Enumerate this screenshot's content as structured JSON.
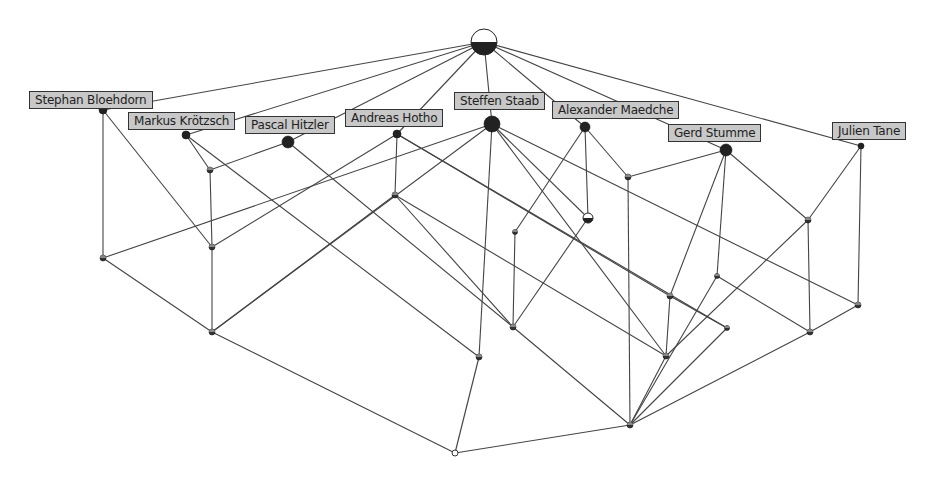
{
  "diagram": {
    "type": "concept-lattice",
    "colors": {
      "edge": "#444444",
      "node_fill": "#222222",
      "label_bg": "#c8c8c8",
      "label_border": "#333333"
    },
    "labels": [
      {
        "id": "SB",
        "text": "Stephan Bloehdorn",
        "x": 29,
        "y": 91
      },
      {
        "id": "MK",
        "text": "Markus Krötzsch",
        "x": 128,
        "y": 112
      },
      {
        "id": "PH",
        "text": "Pascal Hitzler",
        "x": 245,
        "y": 116
      },
      {
        "id": "AH",
        "text": "Andreas Hotho",
        "x": 345,
        "y": 109
      },
      {
        "id": "SS",
        "text": "Steffen Staab",
        "x": 454,
        "y": 92
      },
      {
        "id": "AM",
        "text": "Alexander Maedche",
        "x": 552,
        "y": 101
      },
      {
        "id": "GS",
        "text": "Gerd Stumme",
        "x": 668,
        "y": 124
      },
      {
        "id": "JT",
        "text": "Julien Tane",
        "x": 832,
        "y": 122
      }
    ],
    "nodes": [
      {
        "id": "T",
        "x": 484,
        "y": 42,
        "r": 13,
        "style": "half"
      },
      {
        "id": "SB",
        "x": 103,
        "y": 110,
        "r": 4,
        "style": "filled"
      },
      {
        "id": "MK",
        "x": 186,
        "y": 135,
        "r": 4,
        "style": "filled"
      },
      {
        "id": "PH",
        "x": 288,
        "y": 142,
        "r": 6,
        "style": "filled"
      },
      {
        "id": "AH",
        "x": 397,
        "y": 134,
        "r": 4,
        "style": "filled"
      },
      {
        "id": "SS",
        "x": 492,
        "y": 124,
        "r": 8,
        "style": "filled"
      },
      {
        "id": "AM",
        "x": 585,
        "y": 127,
        "r": 5,
        "style": "filled"
      },
      {
        "id": "GS",
        "x": 726,
        "y": 150,
        "r": 6,
        "style": "filled"
      },
      {
        "id": "JT",
        "x": 861,
        "y": 146,
        "r": 3,
        "style": "filled"
      },
      {
        "id": "n1",
        "x": 210,
        "y": 170,
        "r": 3,
        "style": "small"
      },
      {
        "id": "n2",
        "x": 628,
        "y": 177,
        "r": 3,
        "style": "small"
      },
      {
        "id": "n3",
        "x": 395,
        "y": 195,
        "r": 3,
        "style": "small"
      },
      {
        "id": "n4",
        "x": 515,
        "y": 232,
        "r": 2.5,
        "style": "small"
      },
      {
        "id": "n5",
        "x": 588,
        "y": 218,
        "r": 5,
        "style": "half"
      },
      {
        "id": "n6",
        "x": 808,
        "y": 220,
        "r": 3,
        "style": "small"
      },
      {
        "id": "n7",
        "x": 103,
        "y": 258,
        "r": 3,
        "style": "small"
      },
      {
        "id": "n8",
        "x": 212,
        "y": 247,
        "r": 3,
        "style": "small"
      },
      {
        "id": "n9",
        "x": 717,
        "y": 276,
        "r": 2.5,
        "style": "small"
      },
      {
        "id": "n10",
        "x": 670,
        "y": 296,
        "r": 3,
        "style": "small"
      },
      {
        "id": "n11",
        "x": 858,
        "y": 305,
        "r": 3,
        "style": "small"
      },
      {
        "id": "n12",
        "x": 212,
        "y": 332,
        "r": 3,
        "style": "small"
      },
      {
        "id": "n13",
        "x": 513,
        "y": 327,
        "r": 3,
        "style": "small"
      },
      {
        "id": "n14",
        "x": 727,
        "y": 328,
        "r": 2.5,
        "style": "small"
      },
      {
        "id": "n15",
        "x": 810,
        "y": 332,
        "r": 3,
        "style": "small"
      },
      {
        "id": "n16",
        "x": 666,
        "y": 356,
        "r": 3,
        "style": "small"
      },
      {
        "id": "n17",
        "x": 479,
        "y": 357,
        "r": 3,
        "style": "small"
      },
      {
        "id": "n18",
        "x": 630,
        "y": 425,
        "r": 3,
        "style": "small"
      },
      {
        "id": "B",
        "x": 455,
        "y": 453,
        "r": 3,
        "style": "empty"
      }
    ],
    "edges": [
      [
        "T",
        "SB"
      ],
      [
        "T",
        "MK"
      ],
      [
        "T",
        "PH"
      ],
      [
        "T",
        "AH"
      ],
      [
        "T",
        "SS"
      ],
      [
        "T",
        "AM"
      ],
      [
        "T",
        "GS"
      ],
      [
        "T",
        "JT"
      ],
      [
        "SB",
        "n7"
      ],
      [
        "SB",
        "n8"
      ],
      [
        "MK",
        "n1"
      ],
      [
        "MK",
        "n17"
      ],
      [
        "PH",
        "n1"
      ],
      [
        "PH",
        "n13"
      ],
      [
        "n1",
        "n8"
      ],
      [
        "AH",
        "n3"
      ],
      [
        "AH",
        "n10"
      ],
      [
        "AH",
        "n14"
      ],
      [
        "AH",
        "n8"
      ],
      [
        "SS",
        "n7"
      ],
      [
        "SS",
        "n12"
      ],
      [
        "SS",
        "n17"
      ],
      [
        "SS",
        "n5"
      ],
      [
        "SS",
        "n16"
      ],
      [
        "SS",
        "n11"
      ],
      [
        "n3",
        "n12"
      ],
      [
        "n3",
        "n16"
      ],
      [
        "n3",
        "n13"
      ],
      [
        "AM",
        "n4"
      ],
      [
        "AM",
        "n5"
      ],
      [
        "AM",
        "n2"
      ],
      [
        "GS",
        "n2"
      ],
      [
        "GS",
        "n10"
      ],
      [
        "GS",
        "n9"
      ],
      [
        "GS",
        "n6"
      ],
      [
        "JT",
        "n6"
      ],
      [
        "JT",
        "n11"
      ],
      [
        "n2",
        "n18"
      ],
      [
        "n4",
        "n13"
      ],
      [
        "n5",
        "n13"
      ],
      [
        "n6",
        "n15"
      ],
      [
        "n6",
        "n16"
      ],
      [
        "n9",
        "n18"
      ],
      [
        "n9",
        "n15"
      ],
      [
        "n10",
        "n16"
      ],
      [
        "n10",
        "n14"
      ],
      [
        "n11",
        "n15"
      ],
      [
        "n14",
        "n18"
      ],
      [
        "n15",
        "n18"
      ],
      [
        "n7",
        "n12"
      ],
      [
        "n8",
        "n12"
      ],
      [
        "n12",
        "B"
      ],
      [
        "n17",
        "B"
      ],
      [
        "n13",
        "n18"
      ],
      [
        "n16",
        "n18"
      ],
      [
        "n18",
        "B"
      ]
    ]
  }
}
